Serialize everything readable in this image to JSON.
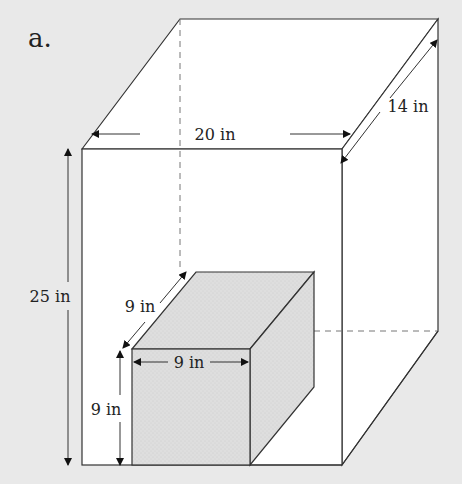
{
  "figure": {
    "label": "a.",
    "background": "#e9e9e9",
    "face_color": "#ffffff",
    "small_box_color": "#dcdcdc",
    "line_color": "#333333"
  },
  "large_box": {
    "width_label": "20 in",
    "depth_label": "14 in",
    "height_label": "25 in"
  },
  "small_box": {
    "width_label": "9 in",
    "depth_label": "9 in",
    "height_label": "9 in"
  }
}
